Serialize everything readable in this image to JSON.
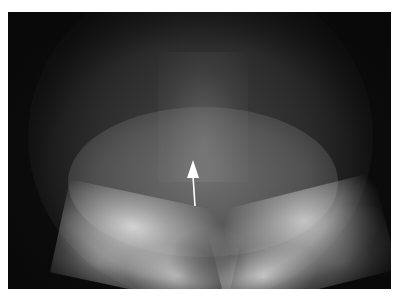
{
  "image": {
    "type": "radiograph",
    "description": "Skull X-ray, Towne-like view showing posterior cranial fossa with petrous bones",
    "background_color": "#0c0c0c",
    "frame": {
      "left": 8,
      "top": 12,
      "width": 383,
      "height": 277
    }
  },
  "annotations": [
    {
      "type": "arrow",
      "color": "#ffffff",
      "direction": "up",
      "tip": [
        193,
        163
      ],
      "tail": [
        195,
        205
      ]
    }
  ],
  "caption": {
    "text": ""
  }
}
